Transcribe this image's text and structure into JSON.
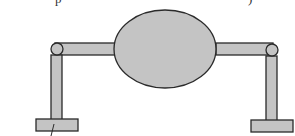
{
  "diagram": {
    "colors": {
      "fill": "#c4c4c4",
      "stroke": "#2a2a2a",
      "background": "#ffffff"
    },
    "components": {
      "body": {
        "label": "central-ellipse",
        "cx": 165,
        "cy": 49,
        "rx": 51,
        "ry": 39
      },
      "left_arm": {
        "label": "left-horizontal-bar",
        "x": 55,
        "y": 43,
        "w": 60,
        "h": 12
      },
      "right_arm": {
        "label": "right-horizontal-bar",
        "x": 216,
        "y": 43,
        "w": 57,
        "h": 12
      },
      "left_joint": {
        "label": "left-pin-joint",
        "cx": 57,
        "cy": 49,
        "r": 6
      },
      "right_joint": {
        "label": "right-pin-joint",
        "cx": 272,
        "cy": 50,
        "r": 6
      },
      "left_leg": {
        "label": "left-vertical-leg",
        "x": 51,
        "y": 55,
        "w": 11,
        "h": 65
      },
      "right_leg": {
        "label": "right-vertical-leg",
        "x": 266,
        "y": 56,
        "w": 11,
        "h": 65
      },
      "left_base": {
        "label": "left-base-plate",
        "x": 36,
        "y": 119,
        "w": 42,
        "h": 12
      },
      "right_base": {
        "label": "right-base-plate",
        "x": 251,
        "y": 120,
        "w": 42,
        "h": 12
      }
    },
    "annotations": {
      "top_text_fragments": [
        "p",
        ")"
      ],
      "leader_line": "slanted pointer line below left base plate"
    }
  }
}
